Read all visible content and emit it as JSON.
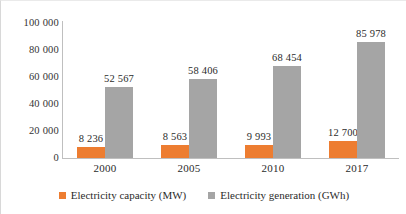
{
  "chart_data": {
    "type": "bar",
    "title": "",
    "subtitle": "",
    "xlabel": "",
    "ylabel": "",
    "categories": [
      "2000",
      "2005",
      "2010",
      "2017"
    ],
    "ylim": [
      0,
      100000
    ],
    "ytick_labels": [
      "0",
      "20 000",
      "40 000",
      "60 000",
      "80 000",
      "100 000"
    ],
    "ytick_values": [
      0,
      20000,
      40000,
      60000,
      80000,
      100000
    ],
    "grid": false,
    "legend_position": "bottom-center",
    "series": [
      {
        "name": "Electricity capacity (MW)",
        "color": "#ED7D31",
        "values": [
          8236,
          9563,
          9993,
          12700
        ],
        "data_labels": [
          "8 236",
          "8 563",
          "9 993",
          "12 700"
        ]
      },
      {
        "name": "Electricity generation (GWh)",
        "color": "#A5A5A5",
        "values": [
          52567,
          58406,
          68454,
          85978
        ],
        "data_labels": [
          "52 567",
          "58 406",
          "68 454",
          "85 978"
        ]
      }
    ]
  },
  "legend": {
    "items": [
      {
        "label": "Electricity capacity (MW)",
        "color": "#ED7D31"
      },
      {
        "label": "Electricity generation (GWh)",
        "color": "#A5A5A5"
      }
    ]
  }
}
